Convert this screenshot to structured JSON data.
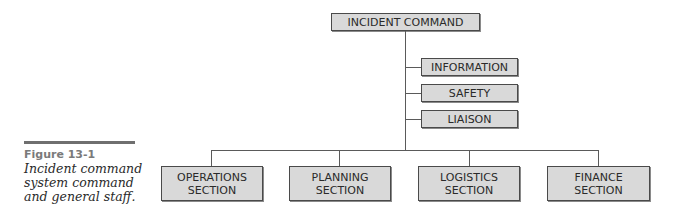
{
  "diagram": {
    "type": "org-chart",
    "root": {
      "label": "INCIDENT COMMAND"
    },
    "command_staff": [
      {
        "label": "INFORMATION"
      },
      {
        "label": "SAFETY"
      },
      {
        "label": "LIAISON"
      }
    ],
    "general_staff": [
      {
        "line1": "OPERATIONS",
        "line2": "SECTION"
      },
      {
        "line1": "PLANNING",
        "line2": "SECTION"
      },
      {
        "line1": "LOGISTICS",
        "line2": "SECTION"
      },
      {
        "line1": "FINANCE",
        "line2": "SECTION"
      }
    ],
    "colors": {
      "box_fill": "#d9d9d9",
      "box_border": "#4a4a4a",
      "line": "#5a5a5a"
    }
  },
  "caption": {
    "figure_label": "Figure 13-1",
    "text": "Incident command system command and general staff."
  }
}
